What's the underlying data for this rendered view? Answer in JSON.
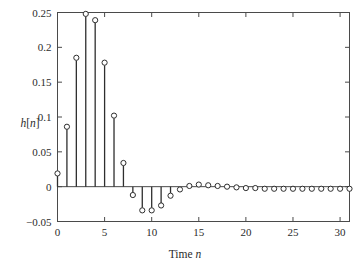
{
  "chart_data": {
    "type": "line",
    "plot_style": "stem",
    "title": "",
    "subtitle": "",
    "xlabel": "Time n",
    "xlabel_parts": {
      "text": "Time ",
      "italic": "n"
    },
    "ylabel": "h[n]",
    "ylabel_parts": {
      "italic_h": "h",
      "brackets_open": "[",
      "italic_n": "n",
      "brackets_close": "]"
    },
    "xlim": [
      0,
      31
    ],
    "ylim": [
      -0.05,
      0.25
    ],
    "grid": false,
    "legend": null,
    "x_ticks": [
      0,
      5,
      10,
      15,
      20,
      25,
      30
    ],
    "x_tick_labels": [
      "0",
      "5",
      "10",
      "15",
      "20",
      "25",
      "30"
    ],
    "y_ticks": [
      -0.05,
      0,
      0.05,
      0.1,
      0.15,
      0.2,
      0.25
    ],
    "y_tick_labels": [
      "-0.05",
      "0",
      "0.05",
      "0.1",
      "0.15",
      "0.2",
      "0.25"
    ],
    "marker": "open-circle",
    "baseline_y": 0,
    "x": [
      0,
      1,
      2,
      3,
      4,
      5,
      6,
      7,
      8,
      9,
      10,
      11,
      12,
      13,
      14,
      15,
      16,
      17,
      18,
      19,
      20,
      21,
      22,
      23,
      24,
      25,
      26,
      27,
      28,
      29,
      30,
      31
    ],
    "values": [
      0.019,
      0.086,
      0.185,
      0.248,
      0.239,
      0.178,
      0.102,
      0.034,
      -0.012,
      -0.034,
      -0.034,
      -0.027,
      -0.013,
      -0.004,
      0.001,
      0.003,
      0.002,
      0.001,
      0.0,
      -0.001,
      -0.002,
      -0.002,
      -0.003,
      -0.003,
      -0.003,
      -0.003,
      -0.003,
      -0.003,
      -0.003,
      -0.003,
      -0.003,
      -0.003
    ],
    "colors": {
      "stem": "#2e2e2e",
      "marker_edge": "#2e2e2e",
      "marker_face": "#ffffff",
      "axis": "#4a4a4a",
      "text": "#2b2b2b",
      "background": "#ffffff"
    }
  }
}
